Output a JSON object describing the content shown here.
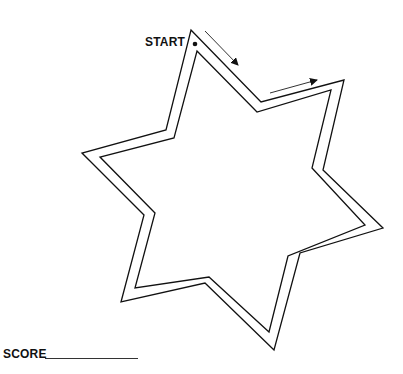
{
  "puzzle": {
    "type": "star-maze-tracing",
    "start_label": "START",
    "score_label": "SCORE",
    "score_value": "",
    "line_color": "#111111",
    "background": "#ffffff",
    "outer_path": [
      [
        191,
        30
      ],
      [
        261,
        102
      ],
      [
        344,
        80
      ],
      [
        323,
        170
      ],
      [
        383,
        228
      ],
      [
        300,
        253
      ],
      [
        274,
        350
      ],
      [
        205,
        283
      ],
      [
        121,
        302
      ],
      [
        144,
        215
      ],
      [
        82,
        153
      ],
      [
        166,
        130
      ]
    ],
    "inner_path": [
      [
        197,
        51
      ],
      [
        257,
        112
      ],
      [
        331,
        90
      ],
      [
        312,
        168
      ],
      [
        365,
        225
      ],
      [
        288,
        256
      ],
      [
        269,
        332
      ],
      [
        209,
        277
      ],
      [
        135,
        288
      ],
      [
        155,
        213
      ],
      [
        100,
        157
      ],
      [
        174,
        138
      ]
    ],
    "start_dot": [
      195,
      44
    ],
    "arrows": [
      {
        "from": [
          205,
          31
        ],
        "to": [
          238,
          65
        ],
        "direction": "down-right"
      },
      {
        "from": [
          270,
          93
        ],
        "to": [
          317,
          80
        ],
        "direction": "right"
      }
    ]
  }
}
